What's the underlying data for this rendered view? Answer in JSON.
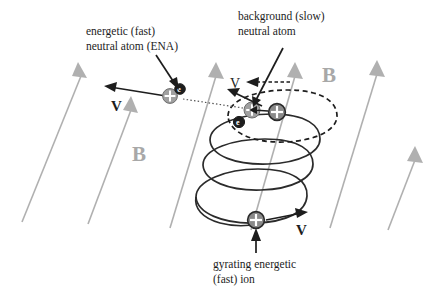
{
  "figure": {
    "background_color": "#ffffff"
  },
  "colors": {
    "field_line": "#b0b0b0",
    "b_label": "#a8a8a8",
    "ink": "#1d1d1d",
    "proton_light": "#a0a0a0",
    "proton_dark": "#8a8a8a",
    "electron": "#1d1d1d"
  },
  "annotations": {
    "ena": {
      "line1": "energetic (fast)",
      "line2": "neutral atom (ENA)"
    },
    "background_atom": {
      "line1": "background (slow)",
      "line2": "neutral atom"
    },
    "gyrating_ion": {
      "line1": "gyrating energetic",
      "line2": "(fast) ion"
    }
  },
  "field_labels": [
    {
      "name": "b-left",
      "text": "B"
    },
    {
      "name": "b-right",
      "text": "B"
    }
  ],
  "velocity_labels": [
    {
      "name": "v-ena",
      "text": "V",
      "style": "bold"
    },
    {
      "name": "v-background-atom",
      "text": "V",
      "style": "thin"
    },
    {
      "name": "v-gyrating-ion",
      "text": "V",
      "style": "bold"
    }
  ],
  "particles": [
    {
      "name": "ena-proton",
      "symbol": "+"
    },
    {
      "name": "ena-electron",
      "symbol": "e"
    },
    {
      "name": "background-atom-proton",
      "symbol": "+"
    },
    {
      "name": "background-atom-electron",
      "symbol": "e"
    },
    {
      "name": "energetic-ion-proton",
      "symbol": "+"
    },
    {
      "name": "gyrating-ion-proton",
      "symbol": "+"
    }
  ],
  "structures": {
    "helix_turns": 3,
    "dashed_orbit": "electron capture orbit",
    "ena_trajectory": "dotted escape path"
  }
}
